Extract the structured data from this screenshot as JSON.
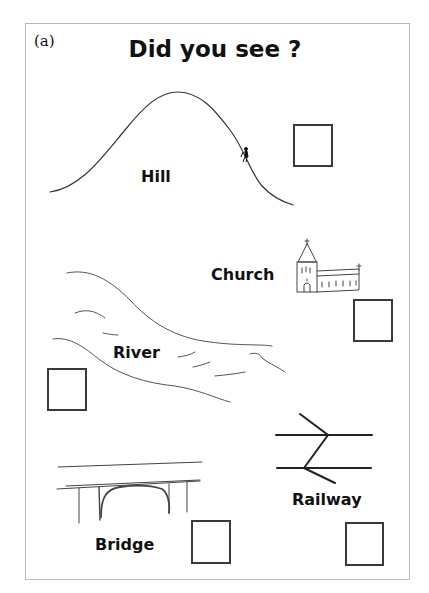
{
  "panel_label": "(a)",
  "title": "Did you see ?",
  "items": [
    {
      "id": "hill",
      "label": "Hill",
      "checked": false
    },
    {
      "id": "church",
      "label": "Church",
      "checked": false
    },
    {
      "id": "river",
      "label": "River",
      "checked": false
    },
    {
      "id": "bridge",
      "label": "Bridge",
      "checked": false
    },
    {
      "id": "railway",
      "label": "Railway",
      "checked": false
    }
  ],
  "icons": {
    "hill": "hill-with-hiker-sketch",
    "church": "church-sketch",
    "river": "river-sketch",
    "bridge": "bridge-sketch",
    "railway": "railway-symbol"
  },
  "colors": {
    "ink": "#111111",
    "sketch": "#333333",
    "frame": "#b8b8b8",
    "checkbox_border": "#3a3a3a"
  }
}
